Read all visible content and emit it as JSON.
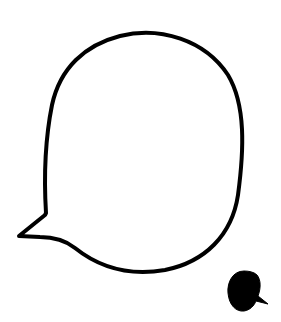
{
  "illustration": {
    "description": "Hand-drawn speech bubble outline with a small filled speech bubble at bottom right",
    "stroke_color": "#000000",
    "fill_color": "#000000",
    "background": "#ffffff",
    "icons": [
      "large-speech-bubble-outline-icon",
      "small-filled-speech-bubble-icon"
    ]
  }
}
